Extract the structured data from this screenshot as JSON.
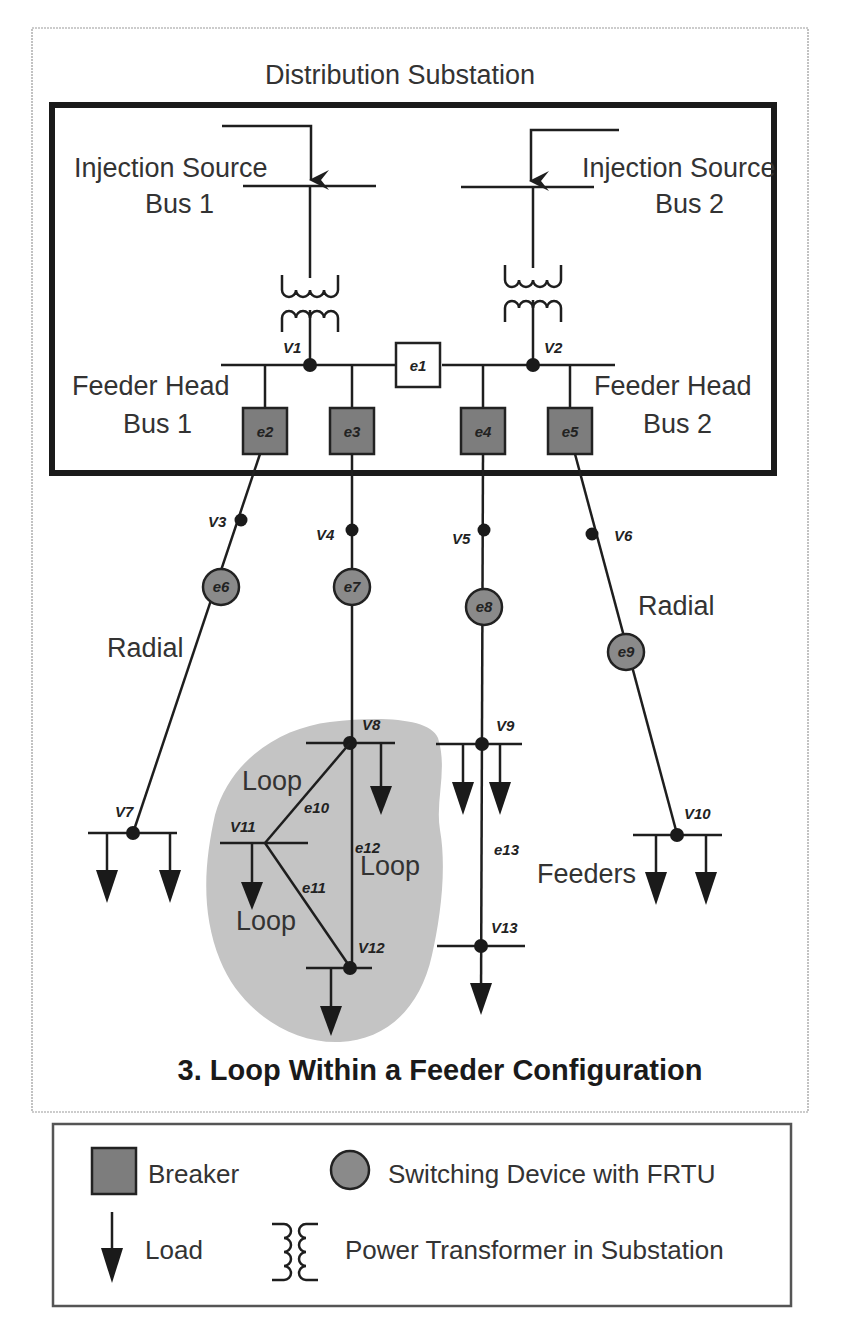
{
  "figure": {
    "substation_title": "Distribution Substation",
    "caption": "3. Loop Within a Feeder Configuration",
    "injection_sources": [
      {
        "line1": "Injection Source",
        "line2": "Bus 1"
      },
      {
        "line1": "Injection Source",
        "line2": "Bus 2"
      }
    ],
    "feeder_heads": [
      {
        "line1": "Feeder Head",
        "line2": "Bus 1"
      },
      {
        "line1": "Feeder Head",
        "line2": "Bus 2"
      }
    ],
    "region_labels": {
      "radial_left": "Radial",
      "radial_right": "Radial",
      "loop_top": "Loop",
      "loop_right": "Loop",
      "loop_bottom": "Loop",
      "feeders": "Feeders"
    },
    "nodes": {
      "v1": "V1",
      "v2": "V2",
      "v3": "V3",
      "v4": "V4",
      "v5": "V5",
      "v6": "V6",
      "v7": "V7",
      "v8": "V8",
      "v9": "V9",
      "v10": "V10",
      "v11": "V11",
      "v12": "V12",
      "v13": "V13"
    },
    "edges": {
      "e1": "e1",
      "e2": "e2",
      "e3": "e3",
      "e4": "e4",
      "e5": "e5",
      "e6": "e6",
      "e7": "e7",
      "e8": "e8",
      "e9": "e9",
      "e10": "e10",
      "e11": "e11",
      "e12": "e12",
      "e13": "e13"
    },
    "colors": {
      "device_fill": "#7d7d7d",
      "loop_region": "#c4c4c4",
      "line": "#1e1e1e"
    }
  },
  "legend": {
    "breaker": "Breaker",
    "switching_device": "Switching Device with FRTU",
    "load": "Load",
    "transformer": "Power Transformer in Substation"
  }
}
